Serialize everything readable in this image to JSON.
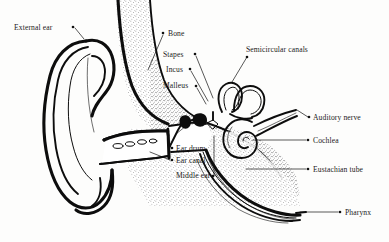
{
  "figure": {
    "type": "anatomical-diagram",
    "background_color": "#fdfdfc",
    "ink_color": "#0d0d0d",
    "style": "black-and-white stippled line engraving"
  },
  "labels": [
    {
      "id": "external-ear",
      "text": "External ear",
      "text_x": 14,
      "text_y": 30,
      "anchor": "start",
      "dot_x": 73,
      "dot_y": 27,
      "leader": "M 75 28 L 84 39"
    },
    {
      "id": "bone",
      "text": "Bone",
      "text_x": 168,
      "text_y": 36,
      "anchor": "start",
      "dot_x": 163,
      "dot_y": 33,
      "leader": "M 163 35 L 148 70"
    },
    {
      "id": "stapes",
      "text": "Stapes",
      "text_x": 163,
      "text_y": 57,
      "anchor": "start",
      "dot_x": 195,
      "dot_y": 54,
      "leader": "M 196 56 L 213 98"
    },
    {
      "id": "incus",
      "text": "Incus",
      "text_x": 166,
      "text_y": 72,
      "anchor": "start",
      "dot_x": 190,
      "dot_y": 69,
      "leader": "M 191 71 L 208 101"
    },
    {
      "id": "malleus",
      "text": "Malleus",
      "text_x": 163,
      "text_y": 88,
      "anchor": "start",
      "dot_x": 196,
      "dot_y": 86,
      "leader": "M 197 88 L 206 104"
    },
    {
      "id": "semicircular-canals",
      "text": "Semicircular canals",
      "text_x": 246,
      "text_y": 52,
      "anchor": "start",
      "dot_x": 247,
      "dot_y": 57,
      "leader": "M 247 57 L 232 82"
    },
    {
      "id": "auditory-nerve",
      "text": "Auditory nerve",
      "text_x": 313,
      "text_y": 120,
      "anchor": "start",
      "dot_x": 309,
      "dot_y": 117,
      "leader": "M 308 117 L 297 110"
    },
    {
      "id": "cochlea",
      "text": "Cochlea",
      "text_x": 313,
      "text_y": 143,
      "anchor": "start",
      "dot_x": 308,
      "dot_y": 140,
      "leader": "M 306 140 L 253 140"
    },
    {
      "id": "eustachian-tube",
      "text": "Eustachian tube",
      "text_x": 313,
      "text_y": 172,
      "anchor": "start",
      "dot_x": 308,
      "dot_y": 169,
      "leader": "M 306 169 L 246 169"
    },
    {
      "id": "pharynx",
      "text": "Pharynx",
      "text_x": 345,
      "text_y": 215,
      "anchor": "start",
      "dot_x": 340,
      "dot_y": 212,
      "leader": "M 338 212 L 300 212"
    },
    {
      "id": "ear-drum",
      "text": "Ear drum",
      "text_x": 176,
      "text_y": 151,
      "anchor": "start",
      "dot_x": 172,
      "dot_y": 148,
      "leader": "M 171 148 L 166 131"
    },
    {
      "id": "ear-canal",
      "text": "Ear canal",
      "text_x": 176,
      "text_y": 163,
      "anchor": "start",
      "dot_x": 172,
      "dot_y": 160,
      "leader": "M 170 160 L 150 152"
    },
    {
      "id": "middle-ear",
      "text": "Middle ear",
      "text_x": 176,
      "text_y": 178,
      "anchor": "start",
      "dot_x": 213,
      "dot_y": 176,
      "leader": "M 214 176 L 214 136"
    }
  ],
  "structures": [
    {
      "id": "pinna",
      "name": "External ear (pinna)"
    },
    {
      "id": "ear-canal-structure",
      "name": "Ear canal (auditory meatus)"
    },
    {
      "id": "ear-drum-structure",
      "name": "Ear drum (tympanic membrane)"
    },
    {
      "id": "ossicles",
      "name": "Ossicles: malleus, incus, stapes"
    },
    {
      "id": "semicircular-canals-structure",
      "name": "Semicircular canals"
    },
    {
      "id": "cochlea-structure",
      "name": "Cochlea"
    },
    {
      "id": "auditory-nerve-structure",
      "name": "Auditory nerve"
    },
    {
      "id": "eustachian-tube-structure",
      "name": "Eustachian tube"
    },
    {
      "id": "bone-structure",
      "name": "Temporal bone (stippled)"
    },
    {
      "id": "pharynx-structure",
      "name": "Pharynx"
    }
  ]
}
